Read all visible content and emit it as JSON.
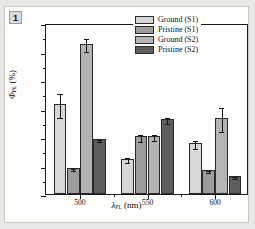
{
  "panel": {
    "badge_label": "1"
  },
  "chart_data": {
    "type": "bar",
    "title": "",
    "xlabel": "λPL (nm)",
    "ylabel": "ΦPL (%)",
    "categories": [
      "500",
      "550",
      "600"
    ],
    "ylim": [
      0,
      30
    ],
    "yticks": [
      0,
      5,
      10,
      15,
      20,
      25,
      30
    ],
    "ytick_labels": [
      "0",
      "5",
      "10",
      "15",
      "20",
      "25",
      "30"
    ],
    "grid": false,
    "legend_position": "top-right",
    "series": [
      {
        "name": "Ground (S1)",
        "color": "#d7d7d7",
        "values": [
          15.8,
          6.2,
          8.9
        ],
        "errors": [
          2.1,
          0.45,
          0.7
        ]
      },
      {
        "name": "Pristine (S1)",
        "color": "#9c9c9c",
        "values": [
          4.6,
          10.1,
          4.2
        ],
        "errors": [
          0.2,
          0.6,
          0.15
        ]
      },
      {
        "name": "Ground (S2)",
        "color": "#b4b4b4",
        "values": [
          26.4,
          10.2,
          13.3
        ],
        "errors": [
          1.1,
          0.55,
          2.1
        ]
      },
      {
        "name": "Pristine (S2)",
        "color": "#5e5e5e",
        "values": [
          9.6,
          13.1,
          3.1
        ],
        "errors": [
          0.2,
          0.55,
          0.15
        ]
      }
    ]
  },
  "axis_titles": {
    "x_symbol": "λ",
    "x_sub": "PL",
    "x_unit": "(nm)",
    "y_symbol": "Φ",
    "y_sub": "PL",
    "y_unit": "(%)"
  }
}
